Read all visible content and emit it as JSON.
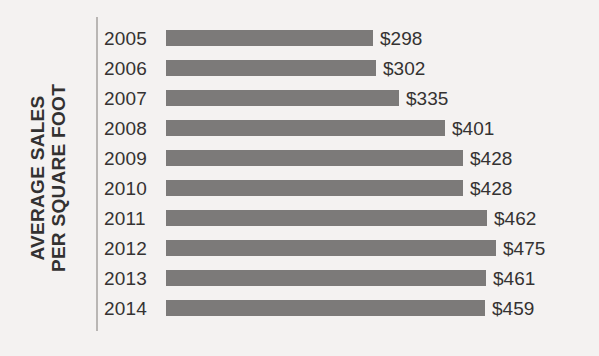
{
  "chart_data": {
    "type": "bar",
    "orientation": "horizontal",
    "title": "",
    "subtitle": "",
    "xlabel": "",
    "ylabel": "AVERAGE SALES PER SQUARE FOOT",
    "ylabel_lines": [
      "AVERAGE SALES",
      "PER SQUARE FOOT"
    ],
    "categories": [
      "2005",
      "2006",
      "2007",
      "2008",
      "2009",
      "2010",
      "2011",
      "2012",
      "2013",
      "2014"
    ],
    "values": [
      298,
      302,
      335,
      401,
      428,
      428,
      462,
      475,
      461,
      459
    ],
    "value_labels": [
      "$298",
      "$302",
      "$335",
      "$401",
      "$428",
      "$428",
      "$462",
      "$475",
      "$461",
      "$459"
    ],
    "xlim": [
      0,
      500
    ],
    "grid": false,
    "legend": false,
    "legend_position": "none",
    "bar_color": "#7c7a79",
    "text_color": "#343232",
    "background_color": "#f4f2f1",
    "axis_line_color": "#b9b6b4"
  },
  "axis": {
    "title_line1": "AVERAGE SALES",
    "title_line2": "PER SQUARE FOOT"
  }
}
